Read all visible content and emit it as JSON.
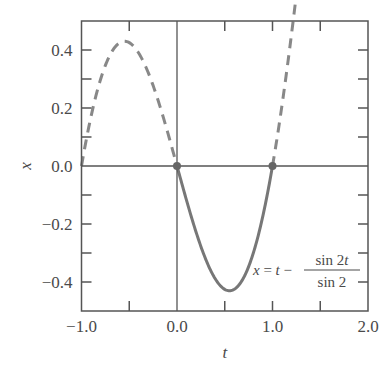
{
  "chart_data": {
    "type": "line",
    "title": "",
    "xlabel": "t",
    "ylabel": "x",
    "xlim": [
      -1.0,
      2.0
    ],
    "ylim": [
      -0.5,
      0.5
    ],
    "grid": false,
    "legend": null,
    "x_ticks": [
      -1.0,
      0.0,
      1.0,
      2.0
    ],
    "x_tick_labels": [
      "−1.0",
      "0.0",
      "1.0",
      "2.0"
    ],
    "x_minor_ticks": [
      -0.5,
      0.5,
      1.5
    ],
    "y_ticks": [
      -0.4,
      -0.2,
      0.0,
      0.2,
      0.4
    ],
    "y_tick_labels": [
      "−0.4",
      "−0.2",
      "0.0",
      "0.2",
      "0.4"
    ],
    "y_minor_ticks": [
      -0.3,
      -0.1,
      0.1,
      0.3
    ],
    "reference_lines": {
      "vertical_at_t": 0.0,
      "horizontal_at_x": 0.0
    },
    "annotation": {
      "text": "x = t − sin 2t / sin 2",
      "lhs": "x = t −",
      "numerator": "sin 2t",
      "denominator": "sin 2"
    },
    "series": [
      {
        "name": "solution on [0, 1]",
        "style": "solid",
        "color": "#777777",
        "formula": "t - sin(2t)/sin(2)",
        "t_range": [
          0.0,
          1.0
        ],
        "x": [
          0.0,
          0.1,
          0.2,
          0.3,
          0.4,
          0.5,
          0.6,
          0.7,
          0.8,
          0.9,
          1.0
        ],
        "y": [
          0.0,
          -0.118,
          -0.229,
          -0.325,
          -0.398,
          -0.425,
          -0.426,
          -0.386,
          -0.282,
          -0.16,
          0.0
        ]
      },
      {
        "name": "extension on [-1, 0]",
        "style": "dashed",
        "color": "#888888",
        "formula": "t - sin(2t)/sin(2)",
        "t_range": [
          -1.0,
          0.0
        ],
        "x": [
          -1.0,
          -0.8,
          -0.6,
          -0.5,
          -0.4,
          -0.2,
          0.0
        ],
        "y": [
          0.0,
          0.282,
          0.426,
          0.425,
          0.398,
          0.229,
          0.0
        ]
      },
      {
        "name": "extension on [1, 2]",
        "style": "dashed",
        "color": "#888888",
        "formula": "t - sin(2t)/sin(2)",
        "t_range": [
          1.0,
          2.0
        ],
        "x": [
          1.0,
          1.2,
          1.4,
          1.5,
          1.6,
          1.8,
          2.0
        ],
        "y": [
          0.0,
          0.282,
          0.426,
          0.425,
          0.398,
          0.229,
          0.0
        ]
      }
    ],
    "points": [
      {
        "t": 0.0,
        "x": 0.0
      },
      {
        "t": 1.0,
        "x": 0.0
      }
    ]
  },
  "colors": {
    "axis": "#555555",
    "solid_curve": "#777777",
    "dashed_curve": "#888888",
    "point": "#666666",
    "text": "#4a4a4a"
  }
}
